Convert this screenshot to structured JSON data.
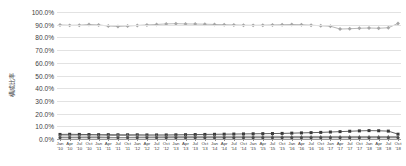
{
  "chart_data": {
    "type": "line",
    "title": "",
    "subtitle": "",
    "xlabel": "",
    "ylabel": "構成比率",
    "ylim": [
      0,
      100
    ],
    "ytick_labels": [
      "100.0%",
      "90.0%",
      "80.0%",
      "70.0%",
      "60.0%",
      "50.0%",
      "40.0%",
      "30.0%",
      "20.0%",
      "10.0%",
      "0.0%"
    ],
    "ytick_values": [
      100,
      90,
      80,
      70,
      60,
      50,
      40,
      30,
      20,
      10,
      0
    ],
    "grid": true,
    "legend": "none",
    "categories": [
      "Jan '10",
      "Apr '10",
      "Jul '10",
      "Oct '10",
      "Jan '11",
      "Apr '11",
      "Jul '11",
      "Oct '11",
      "Jan '12",
      "Apr '12",
      "Jul '12",
      "Oct '12",
      "Jan '13",
      "Apr '13",
      "Jul '13",
      "Oct '13",
      "Jan '14",
      "Apr '14",
      "Jul '14",
      "Oct '14",
      "Jan '15",
      "Apr '15",
      "Jul '15",
      "Oct '15",
      "Jan '16",
      "Apr '16",
      "Jul '16",
      "Oct '16",
      "Jan '17",
      "Apr '17",
      "Jul '17",
      "Oct '17",
      "Jan '18",
      "Apr '18",
      "Jul '18",
      "Oct '18"
    ],
    "x_months": [
      "Jan",
      "Apr",
      "Jul",
      "Oct",
      "Jan",
      "Apr",
      "Jul",
      "Oct",
      "Jan",
      "Apr",
      "Jul",
      "Oct",
      "Jan",
      "Apr",
      "Jul",
      "Oct",
      "Jan",
      "Apr",
      "Jul",
      "Oct",
      "Jan",
      "Apr",
      "Jul",
      "Oct",
      "Jan",
      "Apr",
      "Jul",
      "Oct",
      "Jan",
      "Apr",
      "Jul",
      "Oct",
      "Jan",
      "Apr",
      "Jul",
      "Oct"
    ],
    "x_years": [
      "'10",
      "'10",
      "'10",
      "'10",
      "'11",
      "'11",
      "'11",
      "'11",
      "'12",
      "'12",
      "'12",
      "'12",
      "'13",
      "'13",
      "'13",
      "'13",
      "'14",
      "'14",
      "'14",
      "'14",
      "'15",
      "'15",
      "'15",
      "'15",
      "'16",
      "'16",
      "'16",
      "'16",
      "'17",
      "'17",
      "'17",
      "'17",
      "'18",
      "'18",
      "'18",
      "'18"
    ],
    "series": [
      {
        "name": "series-1",
        "color": "#a6a6a6",
        "marker": "diamond",
        "values": [
          89.8,
          89.5,
          89.6,
          90.2,
          89.8,
          89.0,
          88.6,
          89.0,
          89.4,
          89.8,
          90.2,
          90.6,
          90.8,
          90.6,
          90.5,
          90.4,
          90.2,
          90.0,
          89.8,
          89.6,
          89.5,
          89.6,
          89.8,
          90.0,
          90.2,
          90.0,
          89.6,
          89.2,
          88.8,
          86.6,
          86.8,
          87.2,
          87.4,
          87.2,
          87.6,
          91.0
        ]
      },
      {
        "name": "series-2",
        "color": "#3a3a3a",
        "marker": "square",
        "values": [
          3.6,
          3.7,
          3.6,
          3.5,
          3.4,
          3.4,
          3.3,
          3.3,
          3.3,
          3.2,
          3.2,
          3.2,
          3.3,
          3.4,
          3.5,
          3.6,
          3.7,
          3.8,
          3.9,
          4.0,
          4.1,
          4.2,
          4.3,
          4.4,
          4.6,
          4.8,
          5.0,
          5.2,
          5.5,
          5.8,
          6.1,
          6.4,
          6.6,
          6.5,
          6.2,
          3.8
        ]
      },
      {
        "name": "series-3",
        "color": "#7a7a7a",
        "marker": "triangle",
        "values": [
          2.4,
          2.5,
          2.4,
          2.3,
          2.3,
          2.6,
          2.9,
          2.7,
          2.5,
          2.4,
          2.3,
          2.2,
          2.1,
          2.1,
          2.1,
          2.1,
          2.1,
          2.1,
          2.1,
          2.1,
          2.1,
          2.1,
          2.1,
          2.0,
          2.0,
          2.0,
          2.0,
          2.0,
          2.0,
          2.0,
          2.0,
          2.0,
          2.0,
          2.0,
          2.0,
          2.0
        ]
      },
      {
        "name": "series-4",
        "color": "#4a4a4a",
        "marker": "circle",
        "values": [
          1.0,
          1.0,
          1.0,
          1.0,
          1.0,
          1.0,
          1.0,
          1.0,
          1.0,
          1.0,
          1.0,
          1.0,
          1.0,
          1.0,
          1.0,
          1.0,
          1.0,
          1.0,
          1.0,
          1.0,
          1.0,
          1.0,
          1.0,
          1.0,
          1.0,
          1.0,
          1.0,
          1.0,
          1.0,
          1.0,
          1.0,
          1.0,
          1.0,
          1.0,
          1.0,
          1.0
        ]
      }
    ]
  }
}
